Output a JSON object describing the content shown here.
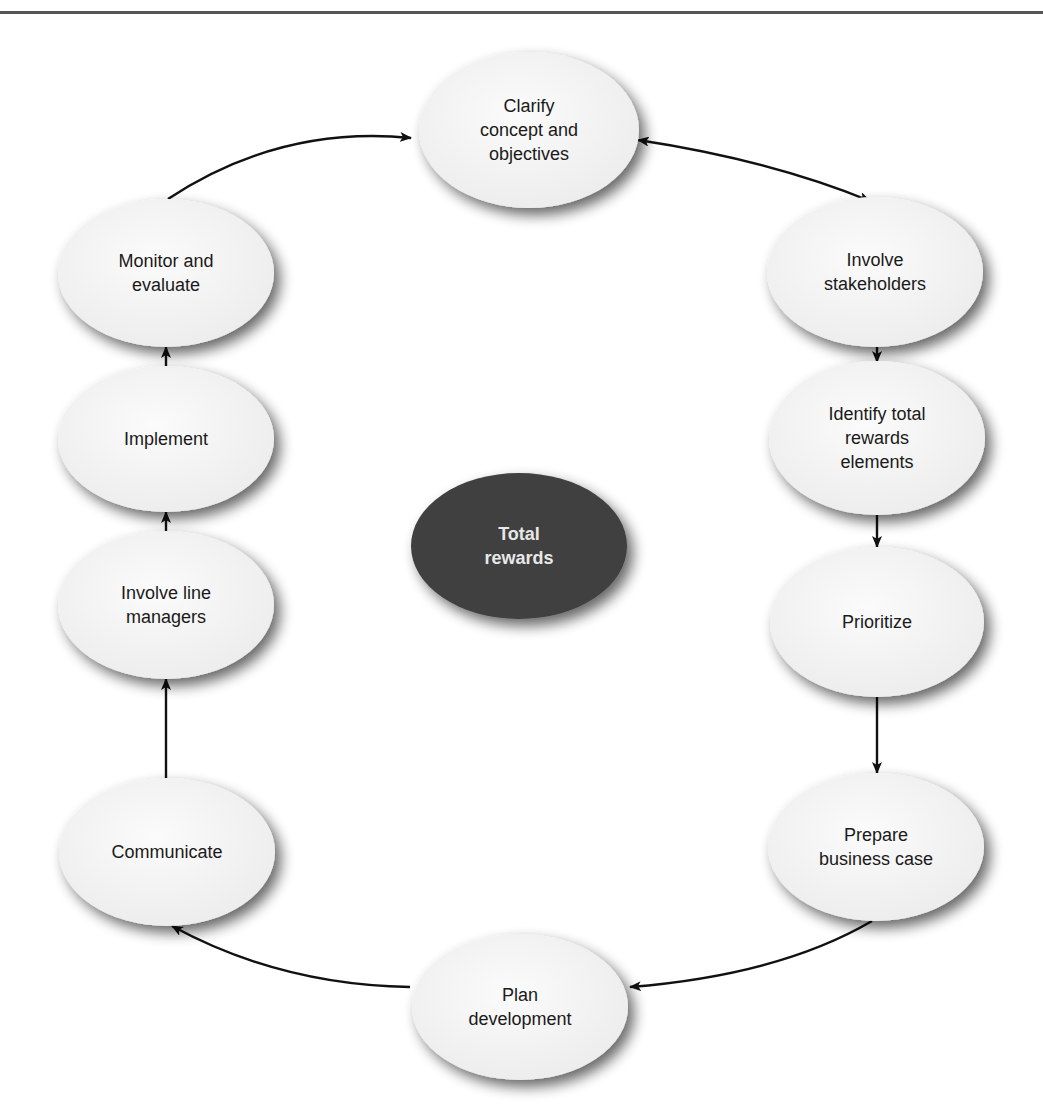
{
  "diagram": {
    "type": "cycle",
    "center": {
      "label_lines": [
        "Total",
        "rewards"
      ],
      "cx": 519,
      "cy": 546,
      "rx": 108,
      "ry": 73,
      "fill": "#3f3f3f"
    },
    "node_fill": "#f4f4f4",
    "nodes": [
      {
        "id": "clarify",
        "label_lines": [
          "Clarify",
          "concept and",
          "objectives"
        ],
        "cx": 529,
        "cy": 130,
        "rx": 110,
        "ry": 78
      },
      {
        "id": "involve-stakeholders",
        "label_lines": [
          "Involve",
          "stakeholders"
        ],
        "cx": 875,
        "cy": 272,
        "rx": 108,
        "ry": 75
      },
      {
        "id": "identify",
        "label_lines": [
          "Identify total",
          "rewards",
          "elements"
        ],
        "cx": 877,
        "cy": 438,
        "rx": 108,
        "ry": 77
      },
      {
        "id": "prioritize",
        "label_lines": [
          "Prioritize"
        ],
        "cx": 877,
        "cy": 622,
        "rx": 107,
        "ry": 75
      },
      {
        "id": "business-case",
        "label_lines": [
          "Prepare",
          "business case"
        ],
        "cx": 876,
        "cy": 847,
        "rx": 108,
        "ry": 74
      },
      {
        "id": "plan-development",
        "label_lines": [
          "Plan",
          "development"
        ],
        "cx": 520,
        "cy": 1007,
        "rx": 108,
        "ry": 73
      },
      {
        "id": "communicate",
        "label_lines": [
          "Communicate"
        ],
        "cx": 167,
        "cy": 852,
        "rx": 108,
        "ry": 74
      },
      {
        "id": "involve-line-managers",
        "label_lines": [
          "Involve line",
          "managers"
        ],
        "cx": 166,
        "cy": 605,
        "rx": 108,
        "ry": 74
      },
      {
        "id": "implement",
        "label_lines": [
          "Implement"
        ],
        "cx": 166,
        "cy": 439,
        "rx": 108,
        "ry": 73
      },
      {
        "id": "monitor",
        "label_lines": [
          "Monitor and",
          "evaluate"
        ],
        "cx": 166,
        "cy": 273,
        "rx": 108,
        "ry": 74
      }
    ],
    "edges": [
      {
        "from": "monitor",
        "to": "clarify",
        "path": "M 168 199 Q 280 125 411 138",
        "start_arrow": false,
        "end_arrow": true
      },
      {
        "from": "clarify",
        "to": "involve-stakeholders",
        "path": "M 638 140 Q 770 160 870 201",
        "start_arrow": true,
        "end_arrow": true
      },
      {
        "from": "involve-stakeholders",
        "to": "identify",
        "path": "M 877 347 L 877 362",
        "start_arrow": false,
        "end_arrow": true
      },
      {
        "from": "identify",
        "to": "prioritize",
        "path": "M 877 515 L 877 547",
        "start_arrow": false,
        "end_arrow": true
      },
      {
        "from": "prioritize",
        "to": "business-case",
        "path": "M 877 697 L 877 773",
        "start_arrow": false,
        "end_arrow": true
      },
      {
        "from": "business-case",
        "to": "plan-development",
        "path": "M 872 921 Q 780 975 630 987",
        "start_arrow": false,
        "end_arrow": true
      },
      {
        "from": "plan-development",
        "to": "communicate",
        "path": "M 410 987 Q 280 985 172 926",
        "start_arrow": false,
        "end_arrow": true
      },
      {
        "from": "communicate",
        "to": "involve-line-managers",
        "path": "M 166 778 L 166 679",
        "start_arrow": false,
        "end_arrow": true
      },
      {
        "from": "involve-line-managers",
        "to": "implement",
        "path": "M 166 531 L 166 512",
        "start_arrow": false,
        "end_arrow": true
      },
      {
        "from": "implement",
        "to": "monitor",
        "path": "M 166 366 L 166 347",
        "start_arrow": false,
        "end_arrow": true
      }
    ]
  }
}
